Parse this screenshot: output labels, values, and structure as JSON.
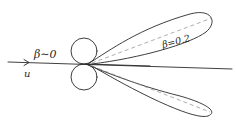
{
  "diagram": {
    "type": "radiation-pattern-sketch",
    "labels": {
      "beta_zero": "β∼0",
      "beta_02": "β=0.2",
      "velocity": "u"
    },
    "elements": [
      {
        "name": "velocity-axis",
        "description": "horizontal line with arrow indicating direction of velocity u"
      },
      {
        "name": "dipole-lobes-beta-zero",
        "description": "two small circles above and below axis (nonrelativistic dipole pattern)"
      },
      {
        "name": "forward-lobes-beta-02",
        "description": "two elongated lobes tilted forward (relativistic beaming)"
      },
      {
        "name": "lobe-axis-dashed",
        "description": "dashed center lines of forward lobes"
      }
    ],
    "colors": {
      "ink": "#2a2a2a",
      "dashed": "#8a8a8a",
      "background": "#ffffff"
    }
  }
}
